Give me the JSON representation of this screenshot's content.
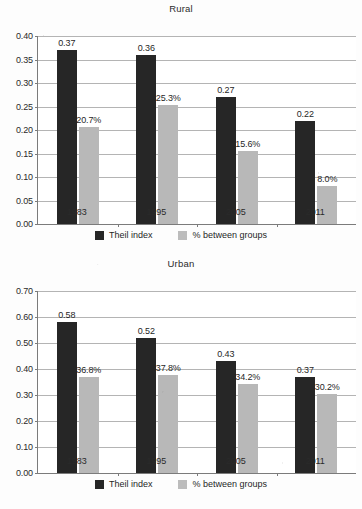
{
  "chart_data": [
    {
      "type": "bar",
      "title": "Rural",
      "xlabel": "",
      "ylabel": "",
      "categories": [
        "1983",
        "1995",
        "2005",
        "2011"
      ],
      "ylim": [
        0.0,
        0.4
      ],
      "yticks": [
        "0.00",
        "0.05",
        "0.10",
        "0.15",
        "0.20",
        "0.25",
        "0.30",
        "0.35",
        "0.40"
      ],
      "grid": true,
      "legend_position": "bottom",
      "series": [
        {
          "name": "Theil index",
          "color": "#262626",
          "values": [
            0.37,
            0.36,
            0.27,
            0.22
          ],
          "labels": [
            "0.37",
            "0.36",
            "0.27",
            "0.22"
          ]
        },
        {
          "name": "% between groups",
          "color": "#b8b8b8",
          "values": [
            0.207,
            0.253,
            0.156,
            0.08
          ],
          "labels": [
            "20.7%",
            "25.3%",
            "15.6%",
            "8.0%"
          ]
        }
      ]
    },
    {
      "type": "bar",
      "title": "Urban",
      "xlabel": "",
      "ylabel": "",
      "categories": [
        "1983",
        "1995",
        "2005",
        "2011"
      ],
      "ylim": [
        0.0,
        0.7
      ],
      "yticks": [
        "0.00",
        "0.10",
        "0.20",
        "0.30",
        "0.40",
        "0.50",
        "0.60",
        "0.70"
      ],
      "grid": true,
      "legend_position": "bottom",
      "series": [
        {
          "name": "Theil index",
          "color": "#262626",
          "values": [
            0.58,
            0.52,
            0.43,
            0.37
          ],
          "labels": [
            "0.58",
            "0.52",
            "0.43",
            "0.37"
          ]
        },
        {
          "name": "% between groups",
          "color": "#b8b8b8",
          "values": [
            0.368,
            0.378,
            0.342,
            0.302
          ],
          "labels": [
            "36.8%",
            "37.8%",
            "34.2%",
            "30.2%"
          ]
        }
      ]
    }
  ]
}
